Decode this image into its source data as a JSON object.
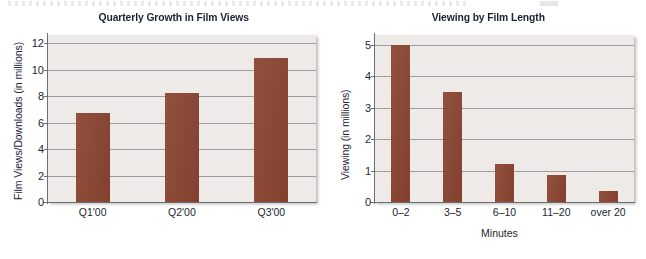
{
  "page": {
    "background_color": "#ffffff",
    "bar_color": "#8a4430",
    "plot_background_color": "#eeeae8",
    "gridline_color": "#8e8d93",
    "title_color": "#1d2233"
  },
  "chart_data": [
    {
      "type": "bar",
      "title": "Quarterly Growth in Film Views",
      "xlabel": "",
      "ylabel": "Film Views/Downloads (in millions)",
      "categories": [
        "Q1'00",
        "Q2'00",
        "Q3'00"
      ],
      "values": [
        6.7,
        8.2,
        10.9
      ],
      "yticks": [
        "0",
        "2",
        "4",
        "6",
        "8",
        "10",
        "12"
      ],
      "ytick_values": [
        0,
        2,
        4,
        6,
        8,
        10,
        12
      ],
      "ylim": [
        0,
        12.6
      ],
      "grid": true,
      "legend": "none"
    },
    {
      "type": "bar",
      "title": "Viewing by Film Length",
      "xlabel": "Minutes",
      "ylabel": "Viewing (in millions)",
      "categories": [
        "0–2",
        "3–5",
        "6–10",
        "11–20",
        "over 20"
      ],
      "values": [
        5.0,
        3.5,
        1.2,
        0.85,
        0.35
      ],
      "yticks": [
        "0",
        "1",
        "2",
        "3",
        "4",
        "5"
      ],
      "ytick_values": [
        0,
        1,
        2,
        3,
        4,
        5
      ],
      "ylim": [
        0,
        5.3
      ],
      "grid": true,
      "legend": "none"
    }
  ]
}
